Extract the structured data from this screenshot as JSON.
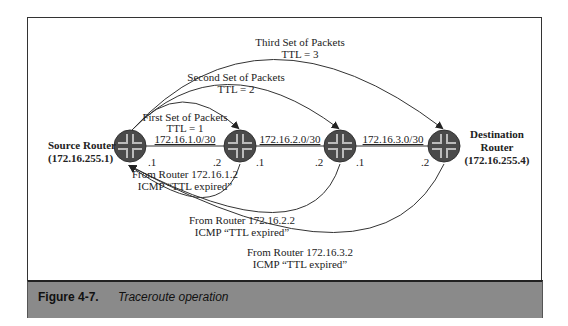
{
  "diagram": {
    "routers": [
      {
        "id": "source",
        "name": "Source Router",
        "address": "(172.16.255.1)",
        "cx": 130,
        "cy": 146
      },
      {
        "id": "r2",
        "cx": 240,
        "cy": 146
      },
      {
        "id": "r3",
        "cx": 340,
        "cy": 146
      },
      {
        "id": "destination",
        "name_line1": "Destination",
        "name_line2": "Router",
        "address": "(172.16.255.4)",
        "cx": 444,
        "cy": 146
      }
    ],
    "links": [
      {
        "subnet": "172.16.1.0/30",
        "left_if": ".1",
        "right_if": ".2"
      },
      {
        "subnet": "172.16.2.0/30",
        "left_if": ".1",
        "right_if": ".2"
      },
      {
        "subnet": "172.16.3.0/30",
        "left_if": ".1",
        "right_if": ".2"
      }
    ],
    "probes": [
      {
        "line1": "First Set of Packets",
        "line2": "TTL = 1"
      },
      {
        "line1": "Second Set of Packets",
        "line2": "TTL = 2"
      },
      {
        "line1": "Third Set of Packets",
        "line2": "TTL = 3"
      }
    ],
    "replies": [
      {
        "line1": "From Router 172.16.1.2",
        "line2": "ICMP “TTL expired”"
      },
      {
        "line1": "From Router 172.16.2.2",
        "line2": "ICMP “TTL expired”"
      },
      {
        "line1": "From Router 172.16.3.2",
        "line2": "ICMP “TTL expired”"
      }
    ]
  },
  "caption": {
    "figure_number": "Figure 4-7.",
    "title": "Traceroute operation"
  },
  "colors": {
    "router_fill": "#4a4a4a",
    "caption_bg": "#8a8a8a",
    "line": "#333333"
  }
}
